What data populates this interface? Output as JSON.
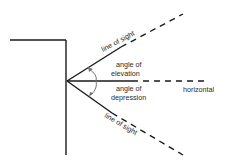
{
  "diagram": {
    "labels": {
      "line_of_sight_upper": "line of sight",
      "line_of_sight_lower": "line of sight",
      "angle_of_elevation_line1": "angle of",
      "angle_of_elevation_line2": "elevation",
      "angle_of_depression_line1": "angle of",
      "angle_of_depression_line2": "depression",
      "horizontal": "horizontal"
    },
    "colors": {
      "line": "#1a1a1a",
      "arc": "#777777",
      "text": "#2a2a2a",
      "background": "#ffffff"
    }
  }
}
